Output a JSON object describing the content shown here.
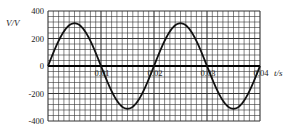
{
  "chart_data": {
    "type": "line",
    "title": "",
    "xlabel": "t/s",
    "ylabel": "V/V",
    "xlim": [
      0,
      0.04
    ],
    "ylim": [
      -400,
      400
    ],
    "x_ticks": [
      0.01,
      0.02,
      0.03,
      0.04
    ],
    "x_tick_labels": [
      "0.01",
      "0.02",
      "0.03",
      "0.04"
    ],
    "y_ticks": [
      400,
      200,
      0,
      -200,
      -400
    ],
    "y_tick_labels": [
      "400",
      "200",
      "0",
      "-200",
      "-400"
    ],
    "grid": true,
    "legend": "none",
    "series": [
      {
        "name": "voltage",
        "function": "311*sin(2*pi*50*t)",
        "amplitude": 311,
        "frequency_hz": 50,
        "period_s": 0.02,
        "x": [
          0,
          0.005,
          0.01,
          0.015,
          0.02,
          0.025,
          0.03,
          0.035,
          0.04
        ],
        "values": [
          0,
          311,
          0,
          -311,
          0,
          311,
          0,
          -311,
          0
        ]
      }
    ]
  },
  "colors": {
    "grid": "#333333",
    "curve": "#111111",
    "background": "#ffffff"
  }
}
